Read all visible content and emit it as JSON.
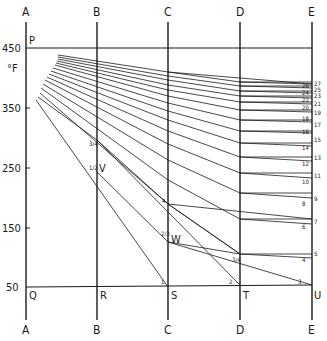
{
  "diagram": {
    "unit_label": "°F",
    "colors": {
      "ink": "#1a1a1a",
      "paper": "#ffffff"
    },
    "vertical_lines": [
      {
        "id": "A",
        "x": 26,
        "top_label": "A",
        "bottom_label": "A"
      },
      {
        "id": "B",
        "x": 97,
        "top_label": "B",
        "bottom_label": "B"
      },
      {
        "id": "C",
        "x": 168,
        "top_label": "C",
        "bottom_label": "C"
      },
      {
        "id": "D",
        "x": 240,
        "top_label": "D",
        "bottom_label": "D"
      },
      {
        "id": "E",
        "x": 312,
        "top_label": "E",
        "bottom_label": "E"
      }
    ],
    "y_ticks": [
      {
        "label": "450",
        "y": 48
      },
      {
        "label": "350",
        "y": 108
      },
      {
        "label": "250",
        "y": 168
      },
      {
        "label": "150",
        "y": 228
      },
      {
        "label": "50",
        "y": 287
      }
    ],
    "horizontal_lines": [
      {
        "id": "P",
        "label": "P",
        "y": 48
      },
      {
        "id": "Q",
        "label": "Q",
        "y": 287
      }
    ],
    "base_points": [
      {
        "label": "Q",
        "x": 30,
        "y": 299
      },
      {
        "label": "R",
        "x": 100,
        "y": 299
      },
      {
        "label": "S",
        "x": 171,
        "y": 299
      },
      {
        "label": "T",
        "x": 243,
        "y": 299
      },
      {
        "label": "U",
        "x": 314,
        "y": 299
      }
    ],
    "marked_points": [
      {
        "label": "V",
        "x": 100,
        "y": 172
      },
      {
        "label": "W",
        "x": 171,
        "y": 242
      }
    ],
    "e_axis_numbers": [
      "27",
      "25",
      "23",
      "21",
      "19",
      "17",
      "15",
      "13",
      "11",
      "9",
      "7",
      "5"
    ],
    "e_axis_inner_numbers": [
      "26",
      "24",
      "22",
      "20",
      "18",
      "16",
      "14",
      "12",
      "10",
      "8",
      "6",
      "4"
    ],
    "intersection_numbers": {
      "S": "1",
      "T": "2",
      "U": "3",
      "D_mid": "3/4",
      "C_upper": "4",
      "C_lower": "2/3",
      "B_upper": "3/4",
      "B_lower": "1/2"
    }
  }
}
